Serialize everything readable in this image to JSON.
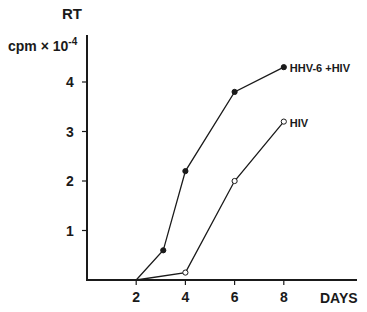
{
  "chart_data": {
    "type": "line",
    "title": "",
    "ylabel_top": "RT",
    "ylabel": "cpm × 10",
    "ylabel_exp": "-4",
    "xlabel": "DAYS",
    "xticks": [
      2,
      4,
      6,
      8
    ],
    "yticks": [
      1,
      2,
      3,
      4
    ],
    "xlim": [
      0,
      10.9
    ],
    "ylim": [
      0,
      4.6
    ],
    "grid": false,
    "legend": "inline labels at line ends",
    "series": [
      {
        "name": "HHV-6 +HIV",
        "marker": "filled-circle",
        "x": [
          2,
          3.1,
          4,
          6,
          8
        ],
        "y": [
          0,
          0.6,
          2.2,
          3.8,
          4.3
        ]
      },
      {
        "name": "HIV",
        "marker": "open-circle",
        "x": [
          2,
          4,
          6,
          8
        ],
        "y": [
          0,
          0.15,
          2.0,
          3.2
        ]
      }
    ]
  },
  "colors": {
    "ink": "#1a1a1a",
    "background": "#ffffff"
  }
}
